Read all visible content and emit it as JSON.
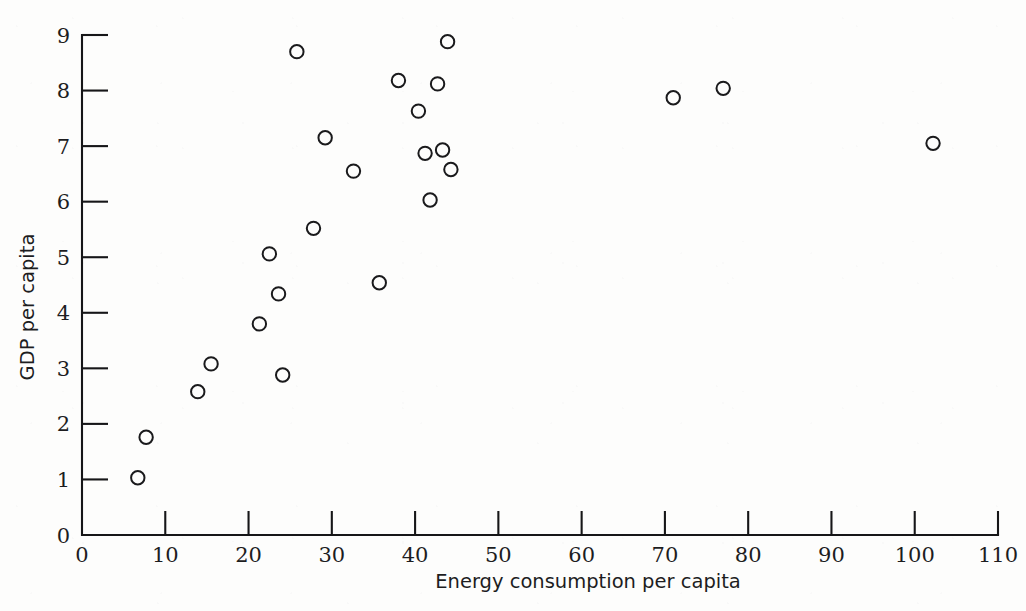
{
  "figure": {
    "background_color": "#fdfdfc",
    "ink_color": "#1a1a1c",
    "marker_shape": "open-circle"
  },
  "chart_data": {
    "type": "scatter",
    "title": "",
    "xlabel": "Energy consumption per capita",
    "ylabel": "GDP per capita",
    "xlim": [
      0,
      110
    ],
    "ylim": [
      0,
      9
    ],
    "xticks": [
      0,
      10,
      20,
      30,
      40,
      50,
      60,
      70,
      80,
      90,
      100,
      110
    ],
    "xtick_labels": [
      "0",
      "10",
      "20",
      "30",
      "40",
      "50",
      "60",
      "70",
      "80",
      "90",
      "100",
      "110"
    ],
    "yticks": [
      0,
      1,
      2,
      3,
      4,
      5,
      6,
      7,
      8,
      9
    ],
    "ytick_labels": [
      "0",
      "1",
      "2",
      "3",
      "4",
      "5",
      "6",
      "7",
      "8",
      "9"
    ],
    "grid": false,
    "legend": null,
    "legend_position": "none",
    "marker": "open-circle",
    "marker_size": 9,
    "n_points": 26,
    "x": [
      6.7,
      7.7,
      13.9,
      15.5,
      21.3,
      22.5,
      23.6,
      24.1,
      25.8,
      27.8,
      29.2,
      32.6,
      35.7,
      38.0,
      40.4,
      41.2,
      41.8,
      42.7,
      43.3,
      43.9,
      44.3,
      44.5,
      71.0,
      77.0,
      102.2,
      25.5
    ],
    "y": [
      1.03,
      1.76,
      2.58,
      3.08,
      3.8,
      5.06,
      4.34,
      2.88,
      8.7,
      5.52,
      7.15,
      6.55,
      4.54,
      8.18,
      7.63,
      6.87,
      6.03,
      8.12,
      6.93,
      8.88,
      6.58,
      6.58,
      7.87,
      8.04,
      7.05,
      8.7
    ],
    "points": [
      {
        "x": 6.7,
        "y": 1.03
      },
      {
        "x": 7.7,
        "y": 1.76
      },
      {
        "x": 13.9,
        "y": 2.58
      },
      {
        "x": 15.5,
        "y": 3.08
      },
      {
        "x": 21.3,
        "y": 3.8
      },
      {
        "x": 22.5,
        "y": 5.06
      },
      {
        "x": 23.6,
        "y": 4.34
      },
      {
        "x": 24.1,
        "y": 2.88
      },
      {
        "x": 25.8,
        "y": 8.7
      },
      {
        "x": 27.8,
        "y": 5.52
      },
      {
        "x": 29.2,
        "y": 7.15
      },
      {
        "x": 32.6,
        "y": 6.55
      },
      {
        "x": 35.7,
        "y": 4.54
      },
      {
        "x": 38.0,
        "y": 8.18
      },
      {
        "x": 40.4,
        "y": 7.63
      },
      {
        "x": 41.2,
        "y": 6.87
      },
      {
        "x": 41.8,
        "y": 6.03
      },
      {
        "x": 42.7,
        "y": 8.12
      },
      {
        "x": 43.3,
        "y": 6.93
      },
      {
        "x": 43.9,
        "y": 8.88
      },
      {
        "x": 44.3,
        "y": 6.58
      },
      {
        "x": 71.0,
        "y": 7.87
      },
      {
        "x": 77.0,
        "y": 8.04
      },
      {
        "x": 102.2,
        "y": 7.05
      }
    ]
  }
}
